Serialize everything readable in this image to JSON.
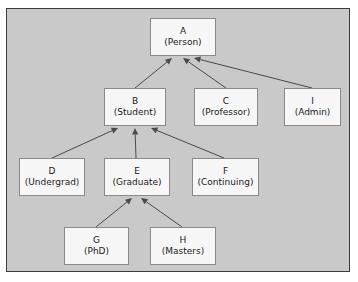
{
  "diagram": {
    "style": {
      "canvas_background": "#c9c9c9",
      "page_background": "#ffffff",
      "frame_border": "#3c3c3c",
      "node_fill": "#f7f7f7",
      "node_border": "#8a8a8a",
      "edge_color": "#4a4a4a",
      "text_color": "#1a1a1a"
    },
    "nodes": [
      {
        "id": "A",
        "key": "A",
        "role": "(Person)",
        "x": 150,
        "y": 18,
        "w": 66,
        "h": 38
      },
      {
        "id": "B",
        "key": "B",
        "role": "(Student)",
        "x": 104,
        "y": 88,
        "w": 62,
        "h": 38
      },
      {
        "id": "C",
        "key": "C",
        "role": "(Professor)",
        "x": 194,
        "y": 88,
        "w": 64,
        "h": 38
      },
      {
        "id": "I",
        "key": "I",
        "role": "(Admin)",
        "x": 284,
        "y": 88,
        "w": 57,
        "h": 38
      },
      {
        "id": "D",
        "key": "D",
        "role": "(Undergrad)",
        "x": 19,
        "y": 158,
        "w": 66,
        "h": 38
      },
      {
        "id": "E",
        "key": "E",
        "role": "(Graduate)",
        "x": 104,
        "y": 158,
        "w": 66,
        "h": 38
      },
      {
        "id": "F",
        "key": "F",
        "role": "(Continuing)",
        "x": 192,
        "y": 158,
        "w": 67,
        "h": 38
      },
      {
        "id": "G",
        "key": "G",
        "role": "(PhD)",
        "x": 64,
        "y": 227,
        "w": 65,
        "h": 38
      },
      {
        "id": "H",
        "key": "H",
        "role": "(Masters)",
        "x": 150,
        "y": 227,
        "w": 66,
        "h": 38
      }
    ],
    "edges": [
      {
        "from": "B",
        "to": "A",
        "x1": 135,
        "y1": 88,
        "x2": 172,
        "y2": 58
      },
      {
        "from": "C",
        "to": "A",
        "x1": 226,
        "y1": 88,
        "x2": 183,
        "y2": 58
      },
      {
        "from": "I",
        "to": "A",
        "x1": 312,
        "y1": 88,
        "x2": 194,
        "y2": 58
      },
      {
        "from": "D",
        "to": "B",
        "x1": 52,
        "y1": 158,
        "x2": 118,
        "y2": 128
      },
      {
        "from": "E",
        "to": "B",
        "x1": 136,
        "y1": 158,
        "x2": 135,
        "y2": 128
      },
      {
        "from": "F",
        "to": "B",
        "x1": 224,
        "y1": 158,
        "x2": 151,
        "y2": 128
      },
      {
        "from": "G",
        "to": "E",
        "x1": 96,
        "y1": 227,
        "x2": 132,
        "y2": 198
      },
      {
        "from": "H",
        "to": "E",
        "x1": 182,
        "y1": 227,
        "x2": 141,
        "y2": 198
      }
    ]
  }
}
